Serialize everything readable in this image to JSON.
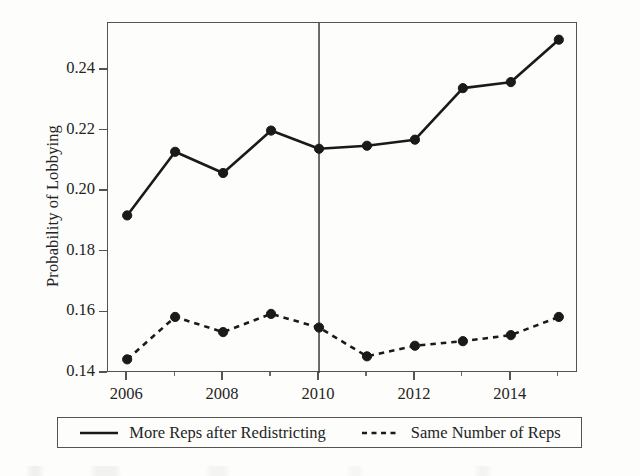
{
  "chart_data": {
    "type": "line",
    "title": "",
    "xlabel": "",
    "ylabel": "Probability of Lobbying",
    "x": [
      2006,
      2007,
      2008,
      2009,
      2010,
      2011,
      2012,
      2013,
      2014,
      2015
    ],
    "xlim": [
      2005.6,
      2015.4
    ],
    "ylim": [
      0.14,
      0.2555
    ],
    "xticks": [
      2006,
      2008,
      2010,
      2012,
      2014
    ],
    "xticklabels": [
      "2006",
      "2008",
      "2010",
      "2012",
      "2014"
    ],
    "xminorticks": [
      2007,
      2009,
      2011,
      2013,
      2015
    ],
    "yticks": [
      0.14,
      0.16,
      0.18,
      0.2,
      0.22,
      0.24
    ],
    "yticklabels": [
      "0.14",
      "0.16",
      "0.18",
      "0.20",
      "0.22",
      "0.24"
    ],
    "grid": false,
    "legend_position": "below-axes",
    "reference_line": {
      "axis": "x",
      "value": 2010,
      "style": "solid",
      "color": "#3b3b3b"
    },
    "series": [
      {
        "name": "More Reps after Redistricting",
        "style": "solid",
        "marker": "filled-circle",
        "color": "#1a1a1a",
        "values": [
          0.192,
          0.213,
          0.206,
          0.22,
          0.214,
          0.215,
          0.217,
          0.234,
          0.236,
          0.25
        ]
      },
      {
        "name": "Same Number of Reps",
        "style": "dashed",
        "marker": "filled-circle",
        "color": "#1a1a1a",
        "values": [
          0.1445,
          0.1585,
          0.1535,
          0.1595,
          0.155,
          0.1455,
          0.149,
          0.1505,
          0.1525,
          0.1585
        ]
      }
    ]
  },
  "legend": {
    "entries": [
      {
        "label": "More Reps after Redistricting",
        "key": "solid-line-key"
      },
      {
        "label": "Same Number of Reps",
        "key": "dashed-line-key"
      }
    ]
  },
  "colors": {
    "ink": "#1a1a1a",
    "frame": "#55534f",
    "page": "#fdfdfb"
  }
}
